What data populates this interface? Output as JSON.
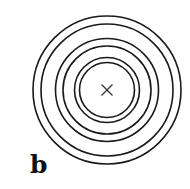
{
  "figure": {
    "panel_label": "b",
    "center": {
      "x": 107,
      "y": 90
    },
    "circle_radii": [
      74,
      66,
      51.5,
      44,
      32.5,
      27.5
    ],
    "center_marker": "cross-icon",
    "stroke_color": "#1a1a1a"
  }
}
